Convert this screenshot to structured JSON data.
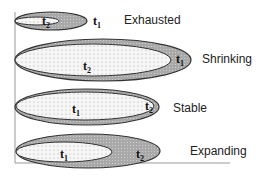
{
  "diagram": {
    "title": "",
    "rows": [
      {
        "label": "Exhausted",
        "outer_label": "t1",
        "inner_label": "t2"
      },
      {
        "label": "Shrinking",
        "outer_label": "t1",
        "inner_label": "t2"
      },
      {
        "label": "Stable",
        "outer_label": "t2",
        "inner_label": "t1"
      },
      {
        "label": "Expanding",
        "outer_label": "t2",
        "inner_label": "t1"
      }
    ],
    "colors": {
      "outer_fill": "#a9a9a9",
      "inner_fill": "#f4f4f4",
      "stroke": "#333333",
      "axis": "#999999"
    }
  }
}
